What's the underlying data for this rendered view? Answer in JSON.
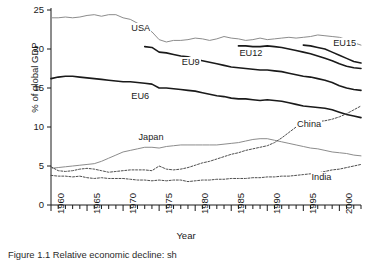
{
  "figure": {
    "caption": "Figure 1.1  Relative economic decline: sh",
    "xlabel": "Year",
    "ylabel": "% of global GDP"
  },
  "chart_data": {
    "type": "line",
    "title": "",
    "xlabel": "Year",
    "ylabel": "% of global GDP",
    "xlim": [
      1960,
      2003
    ],
    "ylim": [
      0,
      25
    ],
    "yticks": [
      0,
      5,
      10,
      15,
      20,
      25
    ],
    "xticks": [
      1960,
      1965,
      1970,
      1975,
      1980,
      1985,
      1990,
      1995,
      2000
    ],
    "xminor_tick_interval": 1,
    "grid": false,
    "legend": "inline-labels",
    "series": [
      {
        "name": "USA",
        "color": "#8c8c8c",
        "style": "solid",
        "width": 1.0,
        "label_x": 1971,
        "label_y": 22.6,
        "x": [
          1960,
          1961,
          1962,
          1963,
          1964,
          1965,
          1966,
          1967,
          1968,
          1969,
          1970,
          1971,
          1972,
          1973,
          1974,
          1975,
          1976,
          1977,
          1978,
          1979,
          1980,
          1981,
          1982,
          1983,
          1984,
          1985,
          1986,
          1987,
          1988,
          1989,
          1990,
          1991,
          1992,
          1993,
          1994,
          1995,
          1996,
          1997,
          1998,
          1999,
          2000,
          2001,
          2002,
          2003
        ],
        "y": [
          24.0,
          24.0,
          24.1,
          24.0,
          24.1,
          24.3,
          24.4,
          24.2,
          24.4,
          24.4,
          24.0,
          23.8,
          23.3,
          22.6,
          22.2,
          21.2,
          20.9,
          21.1,
          21.1,
          21.2,
          21.4,
          21.3,
          21.1,
          21.3,
          21.6,
          21.4,
          21.3,
          21.1,
          21.2,
          21.4,
          21.2,
          21.3,
          21.4,
          21.5,
          21.4,
          21.5,
          21.6,
          21.8,
          21.7,
          21.6,
          21.5,
          21.2,
          20.8,
          20.5
        ]
      },
      {
        "name": "EU15",
        "color": "#1a1a1a",
        "style": "solid",
        "width": 1.6,
        "label_x": 1999,
        "label_y": 20.6,
        "x": [
          1995,
          1996,
          1997,
          1998,
          1999,
          2000,
          2001,
          2002,
          2003
        ],
        "y": [
          20.5,
          20.4,
          20.2,
          20.0,
          19.6,
          19.2,
          18.8,
          18.4,
          18.2
        ]
      },
      {
        "name": "EU12",
        "color": "#1a1a1a",
        "style": "solid",
        "width": 1.6,
        "label_x": 1986,
        "label_y": 19.4,
        "x": [
          1986,
          1987,
          1988,
          1989,
          1990,
          1991,
          1992,
          1993,
          1994,
          1995,
          1996,
          1997,
          1998,
          1999,
          2000,
          2001,
          2002,
          2003
        ],
        "y": [
          20.4,
          20.4,
          20.3,
          20.3,
          20.4,
          20.3,
          20.2,
          20.0,
          19.8,
          19.6,
          19.4,
          19.1,
          18.8,
          18.5,
          18.1,
          17.8,
          17.6,
          17.5
        ]
      },
      {
        "name": "EU9",
        "color": "#1a1a1a",
        "style": "solid",
        "width": 1.6,
        "label_x": 1978,
        "label_y": 18.2,
        "x": [
          1973,
          1974,
          1975,
          1976,
          1977,
          1978,
          1979,
          1980,
          1981,
          1982,
          1983,
          1984,
          1985,
          1986,
          1987,
          1988,
          1989,
          1990,
          1991,
          1992,
          1993,
          1994,
          1995,
          1996,
          1997,
          1998,
          1999,
          2000,
          2001,
          2002,
          2003
        ],
        "y": [
          20.3,
          20.2,
          19.6,
          19.5,
          19.3,
          19.1,
          19.0,
          18.7,
          18.5,
          18.3,
          18.1,
          17.9,
          17.7,
          17.6,
          17.5,
          17.4,
          17.3,
          17.3,
          17.2,
          17.1,
          16.9,
          16.7,
          16.5,
          16.4,
          16.2,
          16.0,
          15.7,
          15.3,
          15.0,
          14.8,
          14.7
        ]
      },
      {
        "name": "EU6",
        "color": "#1a1a1a",
        "style": "solid",
        "width": 1.6,
        "label_x": 1971,
        "label_y": 13.9,
        "x": [
          1960,
          1961,
          1962,
          1963,
          1964,
          1965,
          1966,
          1967,
          1968,
          1969,
          1970,
          1971,
          1972,
          1973,
          1974,
          1975,
          1976,
          1977,
          1978,
          1979,
          1980,
          1981,
          1982,
          1983,
          1984,
          1985,
          1986,
          1987,
          1988,
          1989,
          1990,
          1991,
          1992,
          1993,
          1994,
          1995,
          1996,
          1997,
          1998,
          1999,
          2000,
          2001,
          2002,
          2003
        ],
        "y": [
          16.2,
          16.4,
          16.5,
          16.5,
          16.4,
          16.3,
          16.2,
          16.1,
          16.0,
          15.9,
          15.8,
          15.8,
          15.7,
          15.6,
          15.5,
          15.0,
          15.0,
          14.9,
          14.8,
          14.7,
          14.6,
          14.4,
          14.2,
          14.0,
          13.9,
          13.7,
          13.6,
          13.6,
          13.5,
          13.4,
          13.5,
          13.4,
          13.3,
          13.1,
          12.9,
          12.7,
          12.6,
          12.5,
          12.4,
          12.2,
          11.9,
          11.6,
          11.4,
          11.2
        ]
      },
      {
        "name": "Japan",
        "color": "#8c8c8c",
        "style": "solid",
        "width": 1.0,
        "label_x": 1972,
        "label_y": 8.6,
        "x": [
          1960,
          1961,
          1962,
          1963,
          1964,
          1965,
          1966,
          1967,
          1968,
          1969,
          1970,
          1971,
          1972,
          1973,
          1974,
          1975,
          1976,
          1977,
          1978,
          1979,
          1980,
          1981,
          1982,
          1983,
          1984,
          1985,
          1986,
          1987,
          1988,
          1989,
          1990,
          1991,
          1992,
          1993,
          1994,
          1995,
          1996,
          1997,
          1998,
          1999,
          2000,
          2001,
          2002,
          2003
        ],
        "y": [
          4.7,
          4.8,
          4.9,
          5.0,
          5.1,
          5.2,
          5.3,
          5.6,
          6.0,
          6.4,
          6.8,
          7.0,
          7.2,
          7.4,
          7.4,
          7.3,
          7.5,
          7.6,
          7.7,
          7.7,
          7.7,
          7.7,
          7.7,
          7.7,
          7.8,
          7.9,
          8.0,
          8.2,
          8.4,
          8.5,
          8.5,
          8.3,
          8.1,
          7.9,
          7.7,
          7.5,
          7.3,
          7.2,
          7.0,
          6.8,
          6.7,
          6.6,
          6.4,
          6.3
        ]
      },
      {
        "name": "China",
        "color": "#4d4d4d",
        "style": "dashed",
        "width": 1.0,
        "label_x": 1994,
        "label_y": 10.3,
        "x": [
          1960,
          1961,
          1962,
          1963,
          1964,
          1965,
          1966,
          1967,
          1968,
          1969,
          1970,
          1971,
          1972,
          1973,
          1974,
          1975,
          1976,
          1977,
          1978,
          1979,
          1980,
          1981,
          1982,
          1983,
          1984,
          1985,
          1986,
          1987,
          1988,
          1989,
          1990,
          1991,
          1992,
          1993,
          1994,
          1995,
          1996,
          1997,
          1998,
          1999,
          2000,
          2001,
          2002,
          2003
        ],
        "y": [
          4.9,
          4.4,
          4.3,
          4.4,
          4.6,
          4.7,
          4.6,
          4.4,
          4.2,
          4.3,
          4.4,
          4.5,
          4.5,
          4.5,
          4.4,
          5.0,
          4.6,
          4.5,
          4.6,
          4.8,
          5.1,
          5.4,
          5.6,
          5.9,
          6.2,
          6.5,
          6.7,
          7.0,
          7.2,
          7.4,
          7.6,
          8.0,
          8.6,
          9.3,
          10.0,
          10.5,
          10.7,
          10.7,
          10.8,
          11.0,
          11.3,
          11.7,
          12.2,
          12.7
        ]
      },
      {
        "name": "India",
        "color": "#4d4d4d",
        "style": "dashed",
        "width": 1.0,
        "label_x": 1996,
        "label_y": 3.4,
        "x": [
          1960,
          1961,
          1962,
          1963,
          1964,
          1965,
          1966,
          1967,
          1968,
          1969,
          1970,
          1971,
          1972,
          1973,
          1974,
          1975,
          1976,
          1977,
          1978,
          1979,
          1980,
          1981,
          1982,
          1983,
          1984,
          1985,
          1986,
          1987,
          1988,
          1989,
          1990,
          1991,
          1992,
          1993,
          1994,
          1995,
          1996,
          1997,
          1998,
          1999,
          2000,
          2001,
          2002,
          2003
        ],
        "y": [
          3.8,
          3.7,
          3.7,
          3.6,
          3.7,
          3.5,
          3.4,
          3.5,
          3.4,
          3.4,
          3.4,
          3.3,
          3.2,
          3.2,
          3.1,
          3.2,
          3.1,
          3.2,
          3.2,
          3.0,
          3.1,
          3.2,
          3.2,
          3.3,
          3.3,
          3.4,
          3.4,
          3.4,
          3.5,
          3.5,
          3.6,
          3.6,
          3.7,
          3.7,
          3.8,
          3.9,
          4.0,
          4.1,
          4.3,
          4.5,
          4.6,
          4.8,
          5.0,
          5.2
        ]
      }
    ]
  }
}
